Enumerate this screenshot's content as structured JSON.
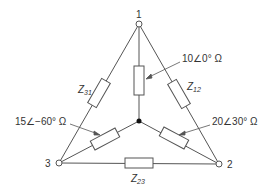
{
  "nodes": {
    "n1": {
      "label": "1"
    },
    "n2": {
      "label": "2"
    },
    "n3": {
      "label": "3"
    }
  },
  "delta": {
    "z12": {
      "sym": "Z",
      "sub": "12"
    },
    "z23": {
      "sym": "Z",
      "sub": "23"
    },
    "z31": {
      "sym": "Z",
      "sub": "31"
    }
  },
  "star": {
    "z1": {
      "label": "10∠0° Ω"
    },
    "z2": {
      "label": "20∠30° Ω"
    },
    "z3": {
      "label": "15∠−60° Ω"
    }
  },
  "colors": {
    "line": "#555555",
    "text": "#333333"
  }
}
